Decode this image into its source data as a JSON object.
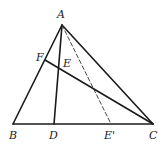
{
  "figure": {
    "type": "geometry-triangle",
    "points": {
      "A": {
        "label": "A",
        "x": 62,
        "y": 25,
        "label_x": 57,
        "label_y": 18
      },
      "B": {
        "label": "B",
        "x": 13,
        "y": 124,
        "label_x": 9,
        "label_y": 139
      },
      "C": {
        "label": "C",
        "x": 153,
        "y": 124,
        "label_x": 149,
        "label_y": 139
      },
      "D": {
        "label": "D",
        "x": 54,
        "y": 124,
        "label_x": 49,
        "label_y": 139
      },
      "E": {
        "label": "E",
        "x": 59,
        "y": 67,
        "label_x": 63,
        "label_y": 67
      },
      "E_prime": {
        "label": "E'",
        "x": 111,
        "y": 124,
        "label_x": 104,
        "label_y": 139
      },
      "F": {
        "label": "F",
        "x": 45,
        "y": 60,
        "label_x": 36,
        "label_y": 61
      }
    },
    "segments": [
      {
        "from": "A",
        "to": "B",
        "style": "solid"
      },
      {
        "from": "A",
        "to": "C",
        "style": "solid"
      },
      {
        "from": "B",
        "to": "C",
        "style": "solid"
      },
      {
        "from": "A",
        "to": "D",
        "style": "solid"
      },
      {
        "from": "F",
        "to": "C",
        "style": "solid"
      },
      {
        "from": "A",
        "to": "E_prime",
        "style": "dashed"
      }
    ]
  }
}
